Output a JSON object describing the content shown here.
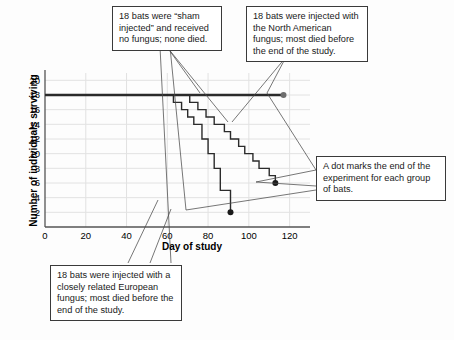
{
  "chart_data": {
    "type": "line",
    "title": "",
    "xlabel": "Day of study",
    "ylabel": "Number of individuals surviving",
    "xlim": [
      0,
      130
    ],
    "ylim": [
      0,
      21
    ],
    "xticks": [
      0,
      20,
      40,
      60,
      80,
      100,
      120
    ],
    "yticks": [
      2,
      4,
      6,
      8,
      10,
      12,
      14,
      16,
      18,
      20
    ],
    "grid": true,
    "legend_position": "none",
    "annotations_as_callouts": true,
    "series": [
      {
        "name": "Sham injected (control)",
        "style": "thick-step",
        "color": "#2b2b2b",
        "endpoint_marker": {
          "x": 117,
          "y": 18,
          "label": "A dot marks the end of the experiment"
        },
        "points": [
          {
            "x": 0,
            "y": 18
          },
          {
            "x": 117,
            "y": 18
          }
        ]
      },
      {
        "name": "North American fungus",
        "style": "step",
        "color": "#2b2b2b",
        "endpoint_marker": {
          "x": 113,
          "y": 6,
          "label": "A dot marks the end of the experiment"
        },
        "points": [
          {
            "x": 0,
            "y": 18
          },
          {
            "x": 71,
            "y": 18
          },
          {
            "x": 71,
            "y": 17
          },
          {
            "x": 75,
            "y": 17
          },
          {
            "x": 75,
            "y": 16
          },
          {
            "x": 79,
            "y": 16
          },
          {
            "x": 79,
            "y": 15
          },
          {
            "x": 83,
            "y": 15
          },
          {
            "x": 83,
            "y": 14
          },
          {
            "x": 88,
            "y": 14
          },
          {
            "x": 88,
            "y": 13
          },
          {
            "x": 91,
            "y": 13
          },
          {
            "x": 91,
            "y": 12
          },
          {
            "x": 95,
            "y": 12
          },
          {
            "x": 95,
            "y": 11
          },
          {
            "x": 98,
            "y": 11
          },
          {
            "x": 98,
            "y": 10
          },
          {
            "x": 102,
            "y": 10
          },
          {
            "x": 102,
            "y": 9
          },
          {
            "x": 105,
            "y": 9
          },
          {
            "x": 105,
            "y": 8
          },
          {
            "x": 110,
            "y": 8
          },
          {
            "x": 110,
            "y": 7
          },
          {
            "x": 113,
            "y": 7
          },
          {
            "x": 113,
            "y": 6
          }
        ]
      },
      {
        "name": "European fungus",
        "style": "step",
        "color": "#2b2b2b",
        "endpoint_marker": {
          "x": 91,
          "y": 2,
          "label": "A dot marks the end of the experiment"
        },
        "points": [
          {
            "x": 0,
            "y": 18
          },
          {
            "x": 63,
            "y": 18
          },
          {
            "x": 63,
            "y": 17
          },
          {
            "x": 67,
            "y": 17
          },
          {
            "x": 67,
            "y": 16
          },
          {
            "x": 70,
            "y": 16
          },
          {
            "x": 70,
            "y": 15
          },
          {
            "x": 73,
            "y": 15
          },
          {
            "x": 73,
            "y": 14
          },
          {
            "x": 77,
            "y": 14
          },
          {
            "x": 77,
            "y": 12
          },
          {
            "x": 80,
            "y": 12
          },
          {
            "x": 80,
            "y": 10
          },
          {
            "x": 83,
            "y": 10
          },
          {
            "x": 83,
            "y": 8
          },
          {
            "x": 86,
            "y": 8
          },
          {
            "x": 86,
            "y": 5
          },
          {
            "x": 91,
            "y": 5
          },
          {
            "x": 91,
            "y": 2
          }
        ]
      }
    ]
  },
  "callouts": {
    "control": "18 bats were “sham injected” and received no fungus; none died.",
    "north_american": "18 bats were injected with the North American fungus; most died before the end of the study.",
    "dot_marker": "A dot marks the end of the experiment for each group of bats.",
    "european": "18 bats were injected with a closely related European fungus; most died before the end of the study."
  },
  "axes": {
    "x_title": "Day of study",
    "y_title": "Number of individuals surviving",
    "x_tick_labels": [
      "0",
      "20",
      "40",
      "60",
      "80",
      "100",
      "120"
    ],
    "y_tick_labels": [
      "2",
      "4",
      "6",
      "8",
      "10",
      "12",
      "14",
      "16",
      "18",
      "20"
    ]
  },
  "colors": {
    "line": "#2b2b2b",
    "grid": "#e2e2e2",
    "axis": "#555555",
    "callout_border": "#3a3a3a",
    "background": "#fdfdfd"
  }
}
